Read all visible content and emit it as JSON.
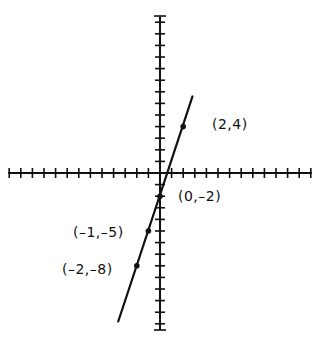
{
  "chart_data": {
    "type": "line",
    "title": "",
    "xlabel": "",
    "ylabel": "",
    "equation_implied": "y = 3x - 2",
    "grid": false,
    "xlim": [
      -13,
      13
    ],
    "ylim": [
      -13.5,
      13.5
    ],
    "tick_spacing": 1,
    "line_segment": {
      "from": [
        -3.6,
        -12.8
      ],
      "to": [
        2.8,
        6.6
      ]
    },
    "points": [
      {
        "x": 2,
        "y": 4,
        "label": "(2,4)"
      },
      {
        "x": 0,
        "y": -2,
        "label": "(0,–2)"
      },
      {
        "x": -1,
        "y": -5,
        "label": "(–1,–5)"
      },
      {
        "x": -2,
        "y": -8,
        "label": "(–2,–8)"
      }
    ]
  },
  "labels": {
    "p1": "(2,4)",
    "p2": "(0,–2)",
    "p3": "(–1,–5)",
    "p4": "(–2,–8)"
  },
  "colors": {
    "ink": "#111111",
    "background": "#ffffff"
  }
}
